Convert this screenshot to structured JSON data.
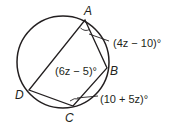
{
  "diagram": {
    "type": "inscribed-quadrilateral",
    "circle": {
      "cx": 63,
      "cy": 62,
      "r": 46
    },
    "colors": {
      "stroke": "#231f20",
      "text": "#231f20",
      "background": "#ffffff"
    },
    "vertices": {
      "A": {
        "label": "A",
        "x": 85,
        "y": 20
      },
      "B": {
        "label": "B",
        "x": 107,
        "y": 68
      },
      "C": {
        "label": "C",
        "x": 73,
        "y": 106
      },
      "D": {
        "label": "D",
        "x": 29,
        "y": 90
      }
    },
    "angles": {
      "A": "(4z − 10)°",
      "B": "(6z − 5)°",
      "C": "(10 + 5z)°"
    }
  }
}
